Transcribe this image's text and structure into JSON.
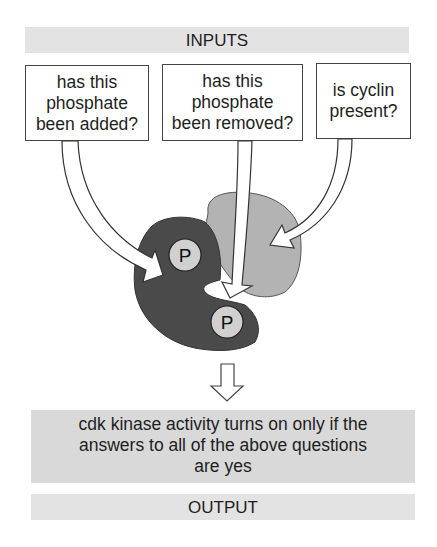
{
  "inputs_label": "INPUTS",
  "questions": [
    {
      "lines": [
        "has this",
        "phosphate",
        "been added?"
      ]
    },
    {
      "lines": [
        "has this",
        "phosphate",
        "been removed?"
      ]
    },
    {
      "lines": [
        "is cyclin",
        "present?"
      ]
    }
  ],
  "phosphate_label": "P",
  "result": {
    "lines": [
      "cdk kinase activity turns on only if the",
      "answers to all of the above questions",
      "are yes"
    ]
  },
  "output_label": "OUTPUT",
  "colors": {
    "cdk": "#4a4a4a",
    "cyclin": "#b3b3b3",
    "phosphate": "#d0d0d0",
    "band": "#e3e3e3"
  }
}
